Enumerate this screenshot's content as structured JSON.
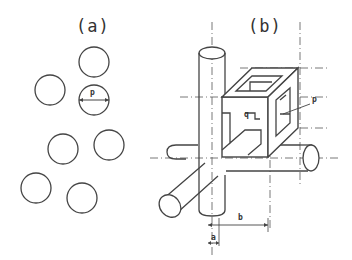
{
  "figure": {
    "panels": [
      {
        "id": "a",
        "label": "(a)",
        "description": "Cross-section of randomly arranged circular fibers",
        "fibers": [
          {
            "cx": 94,
            "cy": 62,
            "r": 15
          },
          {
            "cx": 50,
            "cy": 90,
            "r": 15
          },
          {
            "cx": 94,
            "cy": 100,
            "r": 15,
            "dimension": "p"
          },
          {
            "cx": 63,
            "cy": 149,
            "r": 15
          },
          {
            "cx": 109,
            "cy": 145,
            "r": 15
          },
          {
            "cx": 36,
            "cy": 188,
            "r": 15
          },
          {
            "cx": 82,
            "cy": 198,
            "r": 15
          }
        ],
        "dimension_label": "p"
      },
      {
        "id": "b",
        "label": "(b)",
        "description": "3D cubic lattice unit cell with cylindrical struts and hollow cube",
        "dimension_labels": {
          "p": "p",
          "q": "q",
          "a": "a",
          "b": "b"
        }
      }
    ],
    "stroke_color": "#444444",
    "background": "#ffffff"
  }
}
